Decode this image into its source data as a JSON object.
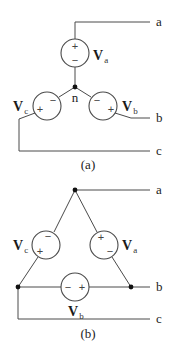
{
  "diagram_a": {
    "caption": "(a)",
    "terminals": {
      "a": "a",
      "b": "b",
      "c": "c"
    },
    "neutral_label": "n",
    "sources": {
      "va": {
        "label": "V",
        "sub": "a",
        "plus": "+",
        "minus": "−"
      },
      "vb": {
        "label": "V",
        "sub": "b",
        "plus": "+",
        "minus": "−"
      },
      "vc": {
        "label": "V",
        "sub": "c",
        "plus": "+",
        "minus": "−"
      }
    }
  },
  "diagram_b": {
    "caption": "(b)",
    "terminals": {
      "a": "a",
      "b": "b",
      "c": "c"
    },
    "sources": {
      "va": {
        "label": "V",
        "sub": "a",
        "plus": "+",
        "minus": "−"
      },
      "vb": {
        "label": "V",
        "sub": "b",
        "plus": "+",
        "minus": "−"
      },
      "vc": {
        "label": "V",
        "sub": "c",
        "plus": "+",
        "minus": "−"
      }
    }
  },
  "colors": {
    "wire": "#4a4a4a",
    "node": "#111111",
    "background": "#ffffff"
  }
}
